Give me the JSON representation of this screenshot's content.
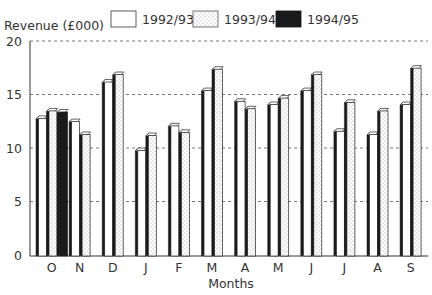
{
  "chart_data": {
    "type": "bar",
    "title": "",
    "ylabel": "Revenue (£000)",
    "xlabel": "Months",
    "ylim": [
      0,
      20
    ],
    "yticks": [
      0,
      5,
      10,
      15,
      20
    ],
    "grid": true,
    "legend_position": "top",
    "categories": [
      "O",
      "N",
      "D",
      "J",
      "F",
      "M",
      "A",
      "M",
      "J",
      "J",
      "A",
      "S"
    ],
    "series": [
      {
        "name": "1992/93",
        "pattern": "white",
        "values": [
          13.0,
          12.7,
          16.4,
          10.0,
          12.3,
          15.6,
          14.6,
          14.3,
          15.6,
          11.8,
          11.5,
          14.3
        ]
      },
      {
        "name": "1993/94",
        "pattern": "dotted",
        "values": [
          13.7,
          11.5,
          17.1,
          11.4,
          11.7,
          17.6,
          13.9,
          14.9,
          17.1,
          14.5,
          13.7,
          17.7
        ]
      },
      {
        "name": "1994/95",
        "pattern": "black",
        "values": [
          13.6,
          null,
          null,
          null,
          null,
          null,
          null,
          null,
          null,
          null,
          null,
          null
        ]
      }
    ]
  },
  "legend": {
    "items": [
      {
        "label": "1992/93"
      },
      {
        "label": "1993/94"
      },
      {
        "label": "1994/95"
      }
    ]
  },
  "axes": {
    "y_title": "Revenue (£000)",
    "x_title": "Months"
  },
  "colors": {
    "axis": "#333333",
    "grid": "#555555",
    "bar_white": "#ffffff",
    "bar_dotted_bg": "#ffffff",
    "bar_dotted_dot": "#aaaaaa",
    "bar_black": "#1a1a1a",
    "side_face": "#1a1a1a",
    "outline": "#222222"
  }
}
